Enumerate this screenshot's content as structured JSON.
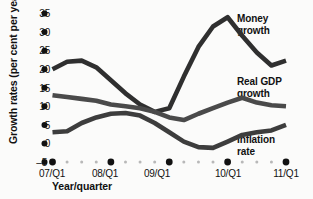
{
  "chart_data": {
    "type": "line",
    "title": "",
    "xlabel": "Year/quarter",
    "ylabel": "Growth rates (per cent per year)",
    "ylim": [
      -5,
      35
    ],
    "yticks": [
      -5,
      0,
      5,
      10,
      15,
      20,
      25,
      30,
      35
    ],
    "ytick_labels": [
      "–5",
      "0",
      "5",
      "10",
      "15",
      "20",
      "25",
      "30",
      "35"
    ],
    "grid": false,
    "legend_position": "inline-right",
    "x_major_labels": [
      "07/Q1",
      "08/Q1",
      "09/Q1",
      "10/Q1",
      "11/Q1"
    ],
    "x": [
      "07/Q1",
      "07/Q2",
      "07/Q3",
      "07/Q4",
      "08/Q1",
      "08/Q2",
      "08/Q3",
      "08/Q4",
      "09/Q1",
      "09/Q2",
      "09/Q3",
      "09/Q4",
      "10/Q1",
      "10/Q2",
      "10/Q3",
      "10/Q4",
      "11/Q1"
    ],
    "series": [
      {
        "name": "Money growth",
        "color": "#2f2f2f",
        "values": [
          20,
          22,
          22.3,
          20.5,
          17,
          13.5,
          10.5,
          8.5,
          9.5,
          18,
          26,
          31.5,
          34,
          29,
          24.5,
          21,
          22.3
        ]
      },
      {
        "name": "Real GDP growth",
        "color": "#4a4a4a",
        "values": [
          13,
          12.5,
          12,
          11.5,
          10.5,
          10,
          9.5,
          8.5,
          7,
          6.3,
          8,
          9.5,
          11,
          12.3,
          11,
          10.3,
          10
        ]
      },
      {
        "name": "Inflation rate",
        "color": "#3d3d3d",
        "values": [
          3,
          3.3,
          5.5,
          7,
          8,
          8.2,
          7.5,
          5.5,
          3,
          0.5,
          -1,
          -1.2,
          0.5,
          2.3,
          3,
          3.5,
          5
        ]
      }
    ],
    "annotations": [
      {
        "text_line1": "Money",
        "text_line2": "growth"
      },
      {
        "text_line1": "Real GDP",
        "text_line2": "growth"
      },
      {
        "text_line1": "Inflation",
        "text_line2": "rate"
      }
    ]
  },
  "axis": {
    "y_title": "Growth rates (per cent per year)",
    "x_title": "Year/quarter"
  }
}
